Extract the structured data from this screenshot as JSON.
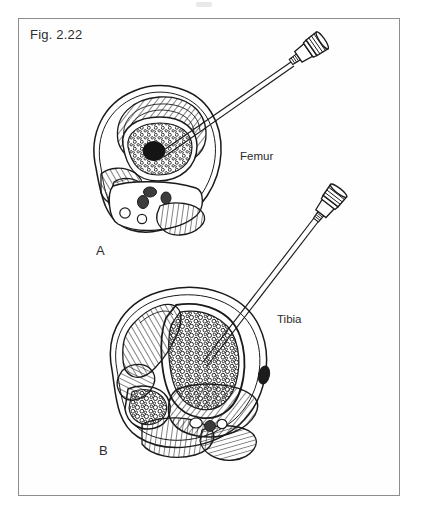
{
  "figure": {
    "label": "Fig. 2.22",
    "caption_visible": false,
    "background_color": "#ffffff",
    "frame_color": "#8d8d8d",
    "ink_color": "#1a1a1a"
  },
  "panels": [
    {
      "letter": "A",
      "organ_label": "Femur",
      "description": "Cross-section of thigh at mid-femur with intraosseous needle inserted into the medullary cavity",
      "structures": [
        "skin and subcutaneous outline",
        "cortical bone ring",
        "medullary marrow cavity (stippled)",
        "nutrient artery / medullary vessel (dark oval)",
        "quadriceps muscle groups (hatched)",
        "hamstring muscle group (hatched)",
        "femoral artery",
        "femoral vein",
        "sciatic nerve",
        "saphenous vein"
      ]
    },
    {
      "letter": "B",
      "organ_label": "Tibia",
      "description": "Cross-section of leg at proximal tibia with intraosseous needle inserted into the tibial marrow",
      "structures": [
        "skin and subcutaneous outline",
        "tibia cortical bone with cancellous marrow (bubbly)",
        "fibula with marrow",
        "anterior compartment muscles (hatched)",
        "posterior compartment muscles (hatched)",
        "interosseous membrane",
        "posterior tibial neurovascular bundle"
      ]
    }
  ],
  "devices": [
    {
      "name": "intraosseous-needle-femur",
      "type": "intraosseous needle with knurled hub and trocar",
      "target_panel": "A"
    },
    {
      "name": "intraosseous-needle-tibia",
      "type": "intraosseous needle with knurled hub and trocar",
      "target_panel": "B"
    }
  ]
}
